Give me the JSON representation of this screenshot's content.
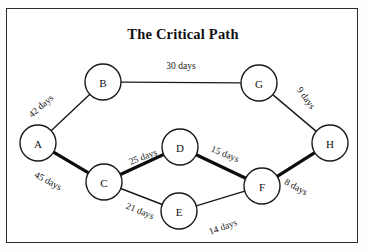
{
  "figure": {
    "title": "The Critical Path",
    "border_color": "#2b2b2b",
    "background_color": "#ffffff"
  },
  "chart_data": {
    "type": "diagram",
    "diagram_kind": "activity-on-node-network",
    "title": "The Critical Path",
    "units": "days",
    "nodes": [
      {
        "id": "A",
        "label": "A",
        "x": 38,
        "y": 143,
        "r": 18
      },
      {
        "id": "B",
        "label": "B",
        "x": 103,
        "y": 82,
        "r": 18
      },
      {
        "id": "C",
        "label": "C",
        "x": 104,
        "y": 182,
        "r": 18
      },
      {
        "id": "D",
        "label": "D",
        "x": 180,
        "y": 147,
        "r": 18
      },
      {
        "id": "E",
        "label": "E",
        "x": 179,
        "y": 211,
        "r": 18
      },
      {
        "id": "F",
        "label": "F",
        "x": 262,
        "y": 186,
        "r": 18
      },
      {
        "id": "G",
        "label": "G",
        "x": 259,
        "y": 83,
        "r": 18
      },
      {
        "id": "H",
        "label": "H",
        "x": 330,
        "y": 143,
        "r": 18
      }
    ],
    "edges": [
      {
        "from": "A",
        "to": "B",
        "weight": 42,
        "label": "42 days",
        "critical": false,
        "label_x": 41,
        "label_y": 106,
        "label_rotation": -41
      },
      {
        "from": "B",
        "to": "G",
        "weight": 30,
        "label": "30 days",
        "critical": false,
        "label_x": 181,
        "label_y": 66,
        "label_rotation": 0
      },
      {
        "from": "G",
        "to": "H",
        "weight": 9,
        "label": "9 days",
        "critical": false,
        "label_x": 306,
        "label_y": 98,
        "label_rotation": 55
      },
      {
        "from": "A",
        "to": "C",
        "weight": 45,
        "label": "45 days",
        "critical": true,
        "label_x": 48,
        "label_y": 181,
        "label_rotation": 28
      },
      {
        "from": "C",
        "to": "D",
        "weight": 25,
        "label": "25 days",
        "critical": true,
        "label_x": 143,
        "label_y": 157,
        "label_rotation": -21
      },
      {
        "from": "D",
        "to": "F",
        "weight": 15,
        "label": "15 days",
        "critical": true,
        "label_x": 225,
        "label_y": 154,
        "label_rotation": 22
      },
      {
        "from": "F",
        "to": "H",
        "weight": 8,
        "label": "8 days",
        "critical": true,
        "label_x": 296,
        "label_y": 187,
        "label_rotation": 29
      },
      {
        "from": "C",
        "to": "E",
        "weight": 21,
        "label": "21 days",
        "critical": false,
        "label_x": 140,
        "label_y": 211,
        "label_rotation": 22
      },
      {
        "from": "E",
        "to": "F",
        "weight": 14,
        "label": "14 days",
        "critical": false,
        "label_x": 223,
        "label_y": 227,
        "label_rotation": -20
      }
    ],
    "critical_path": [
      "A",
      "C",
      "D",
      "F",
      "H"
    ],
    "critical_path_total_days": 93,
    "legend": [],
    "grid": false
  }
}
